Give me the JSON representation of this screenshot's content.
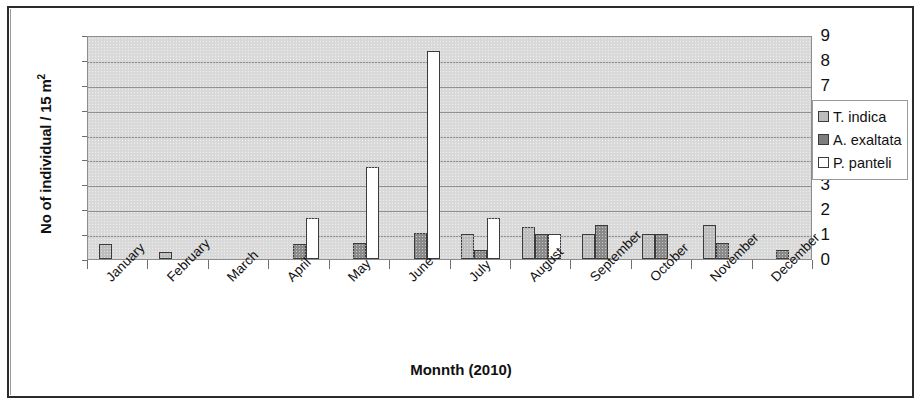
{
  "chart_data": {
    "type": "bar",
    "title": "",
    "xlabel": "Monnth (2010)",
    "ylabel": "No of individual / 15 m2",
    "ylabel_html": "No of individual / 15 m²",
    "ylim": [
      0,
      9
    ],
    "ytick_labels": [
      "9",
      "8",
      "7",
      "6",
      "5",
      "4",
      "3",
      "2",
      "1",
      "0"
    ],
    "ytick_values": [
      9,
      8,
      7,
      6,
      5,
      4,
      3,
      2,
      1,
      0
    ],
    "grid": true,
    "legend_position": "right",
    "categories": [
      "January",
      "February",
      "March",
      "April",
      "May",
      "June",
      "July",
      "August",
      "September",
      "October",
      "November",
      "December"
    ],
    "series": [
      {
        "name": "T. indica",
        "color": "#bdbdbd",
        "values": [
          0.6,
          0.3,
          0,
          0,
          0,
          0,
          1.0,
          1.3,
          1.0,
          1.0,
          1.35,
          0
        ]
      },
      {
        "name": "A. exaltata",
        "color": "#8a8a8a",
        "values": [
          0,
          0,
          0,
          0.6,
          0.65,
          1.05,
          0.35,
          1.0,
          1.35,
          1.0,
          0.65,
          0.35
        ]
      },
      {
        "name": "P. panteli",
        "color": "#ffffff",
        "values": [
          0,
          0,
          0,
          1.65,
          3.7,
          8.35,
          1.65,
          1.0,
          0,
          0,
          0,
          0
        ]
      }
    ]
  },
  "legend": {
    "items": [
      {
        "label": "T. indica",
        "swatch": "legend-swatch-t-indica"
      },
      {
        "label": "A. exaltata",
        "swatch": "legend-swatch-a-exaltata"
      },
      {
        "label": "P. panteli",
        "swatch": "legend-swatch-p-panteli"
      }
    ]
  },
  "axes": {
    "y_title_prefix": "No of individual / 15 m",
    "y_title_sup": "2",
    "x_title": "Monnth (2010)"
  }
}
